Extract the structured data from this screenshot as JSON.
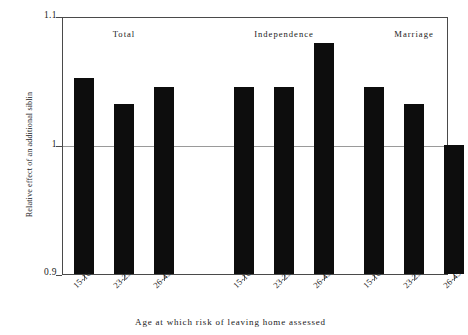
{
  "chart_data": {
    "type": "bar",
    "title": "",
    "xlabel": "Age at which risk of leaving home assessed",
    "ylabel": "Relative effect of an additional siblin",
    "ylim": [
      0.9,
      1.1
    ],
    "ytick_labels": [
      "1.1",
      "1",
      "0.9"
    ],
    "ytick_values": [
      1.1,
      1.0,
      0.9
    ],
    "grid": false,
    "reference_line": 1.0,
    "legend": "none",
    "bar_color": "#0d0d0d",
    "axis_color": "#4a4a4a",
    "groups": [
      {
        "name": "Total",
        "categories": [
          "15-16",
          "23-25",
          "26-45"
        ],
        "values": [
          1.052,
          1.032,
          1.045
        ]
      },
      {
        "name": "Independence",
        "categories": [
          "15-16",
          "23-25",
          "26-45"
        ],
        "values": [
          1.045,
          1.045,
          1.079
        ]
      },
      {
        "name": "Marriage",
        "categories": [
          "15-16",
          "23-25",
          "26-45"
        ],
        "values": [
          1.045,
          1.032,
          1.0
        ]
      }
    ]
  }
}
